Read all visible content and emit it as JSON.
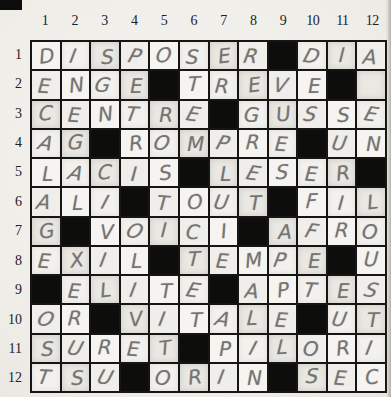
{
  "puzzle": {
    "kind_label": "crossword-grid",
    "size": {
      "cols": 12,
      "rows": 12
    },
    "col_labels": [
      "1",
      "2",
      "3",
      "4",
      "5",
      "6",
      "7",
      "8",
      "9",
      "10",
      "11",
      "12"
    ],
    "row_labels": [
      "1",
      "2",
      "3",
      "4",
      "5",
      "6",
      "7",
      "8",
      "9",
      "10",
      "11",
      "12"
    ],
    "legend": {
      "black": "#",
      "empty": ""
    },
    "rows": [
      [
        "D",
        "I",
        "S",
        "P",
        "O",
        "S",
        "E",
        "R",
        "#",
        "D",
        "I",
        "A"
      ],
      [
        "E",
        "N",
        "G",
        "E",
        "#",
        "T",
        "R",
        "E",
        "V",
        "E",
        "#",
        ""
      ],
      [
        "C",
        "E",
        "N",
        "T",
        "R",
        "E",
        "#",
        "G",
        "U",
        "S",
        "S",
        "E"
      ],
      [
        "A",
        "G",
        "#",
        "R",
        "O",
        "M",
        "P",
        "R",
        "E",
        "#",
        "U",
        "N"
      ],
      [
        "L",
        "A",
        "C",
        "I",
        "S",
        "#",
        "L",
        "E",
        "S",
        "E",
        "R",
        "#"
      ],
      [
        "A",
        "L",
        "I",
        "#",
        "T",
        "O",
        "U",
        "T",
        "#",
        "F",
        "I",
        "L"
      ],
      [
        "G",
        "#",
        "V",
        "O",
        "I",
        "C",
        "I",
        "#",
        "A",
        "F",
        "R",
        "O"
      ],
      [
        "E",
        "X",
        "I",
        "L",
        "#",
        "T",
        "E",
        "M",
        "P",
        "E",
        "#",
        "U"
      ],
      [
        "#",
        "E",
        "L",
        "I",
        "T",
        "E",
        "#",
        "A",
        "P",
        "T",
        "E",
        "S"
      ],
      [
        "O",
        "R",
        "#",
        "V",
        "I",
        "T",
        "A",
        "L",
        "E",
        "#",
        "U",
        "T"
      ],
      [
        "S",
        "U",
        "R",
        "E",
        "T",
        "#",
        "P",
        "I",
        "L",
        "O",
        "R",
        "I"
      ],
      [
        "T",
        "S",
        "U",
        "#",
        "O",
        "R",
        "I",
        "N",
        "#",
        "S",
        "E",
        "C"
      ]
    ]
  },
  "colors": {
    "paper": "#f1efeb",
    "grid_line": "#161513",
    "black_cell": "#0d0d0c",
    "pencil": "#767472",
    "label_ink": "#23211e"
  }
}
